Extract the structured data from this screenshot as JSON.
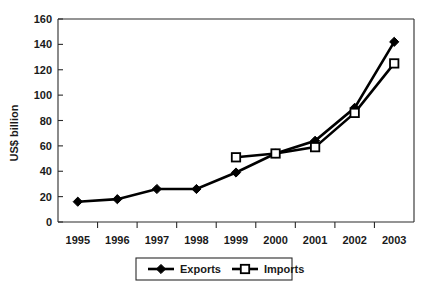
{
  "chart_data": {
    "type": "line",
    "title": "",
    "xlabel": "",
    "ylabel": "US$ billion",
    "categories": [
      "1995",
      "1996",
      "1997",
      "1998",
      "1999",
      "2000",
      "2001",
      "2002",
      "2003"
    ],
    "ylim": [
      0,
      160
    ],
    "ytick_step": 20,
    "yticks": [
      "0",
      "20",
      "40",
      "60",
      "80",
      "100",
      "120",
      "140",
      "160"
    ],
    "grid": false,
    "legend_position": "bottom-center",
    "series": [
      {
        "name": "Exports",
        "marker": "filled-diamond",
        "color": "#000000",
        "x": [
          "1995",
          "1996",
          "1997",
          "1998",
          "1999",
          "2000",
          "2001",
          "2002",
          "2003"
        ],
        "values": [
          16,
          18,
          26,
          26,
          39,
          54,
          64,
          90,
          142
        ]
      },
      {
        "name": "Imports",
        "marker": "open-square",
        "color": "#000000",
        "x": [
          "1999",
          "2000",
          "2001",
          "2002",
          "2003"
        ],
        "values": [
          51,
          54,
          59,
          86,
          125
        ]
      }
    ]
  },
  "legend": {
    "items": [
      {
        "label": "Exports",
        "marker": "filled-diamond"
      },
      {
        "label": "Imports",
        "marker": "open-square"
      }
    ]
  },
  "axes": {
    "y_title": "US$ billion"
  }
}
